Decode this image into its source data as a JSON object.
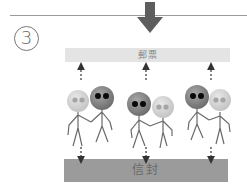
{
  "step": {
    "number": "3",
    "symbol": "③"
  },
  "top_bar": {
    "label": "郵票",
    "color": "#e4e4e4"
  },
  "bottom_bar": {
    "label": "信封",
    "color": "#9b9b9b"
  },
  "arrows": {
    "main_direction": "down",
    "up_arrows": 3,
    "down_arrows": 3
  },
  "groups": [
    {
      "figures": [
        {
          "head": "light",
          "eyes": "grey"
        },
        {
          "head": "dark",
          "eyes": "black"
        }
      ]
    },
    {
      "figures": [
        {
          "head": "dark",
          "eyes": "black"
        },
        {
          "head": "light",
          "eyes": "grey"
        }
      ]
    },
    {
      "figures": [
        {
          "head": "dark",
          "eyes": "black"
        },
        {
          "head": "light",
          "eyes": "grey"
        }
      ]
    }
  ],
  "colors": {
    "line": "#9a9a9a",
    "big_arrow": "#5e5e5e",
    "light_head": "#d2d2d2",
    "dark_head": "#8a8a8a",
    "stroke": "#6a6a6a"
  }
}
